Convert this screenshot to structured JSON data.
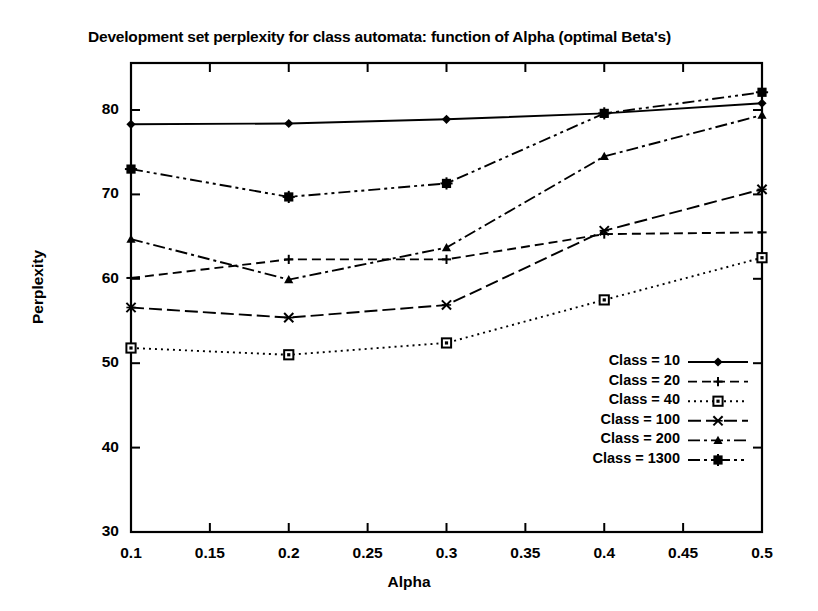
{
  "chart_data": {
    "type": "line",
    "title": "Development set perplexity for class automata: function of Alpha (optimal Beta's)",
    "xlabel": "Alpha",
    "ylabel": "Perplexity",
    "xlim": [
      0.1,
      0.5
    ],
    "ylim": [
      30,
      85
    ],
    "grid": false,
    "legend_position": "lower-right-inside",
    "x": [
      0.1,
      0.2,
      0.3,
      0.4,
      0.5
    ],
    "xticks": [
      "0.1",
      "0.15",
      "0.2",
      "0.25",
      "0.3",
      "0.35",
      "0.4",
      "0.45",
      "0.5"
    ],
    "xtick_values": [
      0.1,
      0.15,
      0.2,
      0.25,
      0.3,
      0.35,
      0.4,
      0.45,
      0.5
    ],
    "yticks": [
      "30",
      "40",
      "50",
      "60",
      "70",
      "80"
    ],
    "ytick_values": [
      30,
      40,
      50,
      60,
      70,
      80
    ],
    "series": [
      {
        "name": "Class = 10",
        "marker": "diamond",
        "dash": "solid",
        "values": [
          78.3,
          78.4,
          78.9,
          79.6,
          80.8
        ]
      },
      {
        "name": "Class = 20",
        "marker": "plus",
        "dash": "dashed",
        "values": [
          60.1,
          62.3,
          62.3,
          65.3,
          65.5
        ]
      },
      {
        "name": "Class = 40",
        "marker": "square",
        "dash": "dotted",
        "values": [
          51.8,
          51.0,
          52.4,
          57.5,
          62.5
        ]
      },
      {
        "name": "Class = 100",
        "marker": "cross",
        "dash": "long-dash",
        "values": [
          56.6,
          55.4,
          56.9,
          65.7,
          70.6
        ]
      },
      {
        "name": "Class = 200",
        "marker": "triangle",
        "dash": "dash-dot",
        "values": [
          64.7,
          59.9,
          63.7,
          74.5,
          79.4
        ]
      },
      {
        "name": "Class = 1300",
        "marker": "star-box",
        "dash": "dash-dot-dot",
        "values": [
          73.0,
          69.7,
          71.3,
          79.6,
          82.1
        ]
      }
    ]
  },
  "legend": {
    "entries": [
      {
        "label": "Class = 10"
      },
      {
        "label": "Class = 20"
      },
      {
        "label": "Class = 40"
      },
      {
        "label": "Class = 100"
      },
      {
        "label": "Class = 200"
      },
      {
        "label": "Class = 1300"
      }
    ]
  }
}
